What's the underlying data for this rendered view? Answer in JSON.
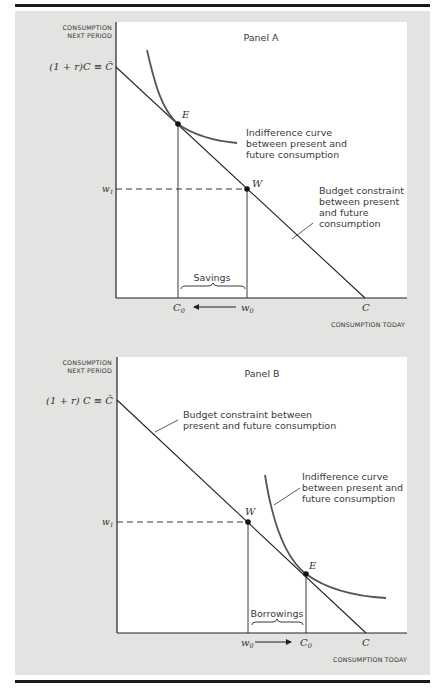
{
  "panels": [
    {
      "id": "A",
      "title": "Panel A",
      "y_axis_label_line1": "CONSUMPTION",
      "y_axis_label_line2": "NEXT PERIOD",
      "x_axis_label": "CONSUMPTION TODAY",
      "y_intercept_label": "(1 + r)C ≡ C̄",
      "y_tick_w1": "w",
      "y_tick_w1_sub": "1",
      "x_tick_C0": "C",
      "x_tick_C0_sub": "0",
      "x_tick_w0": "w",
      "x_tick_w0_sub": "0",
      "x_tick_C": "C",
      "point_E": "E",
      "point_W": "W",
      "arrow_direction": "left (w0 → C0)",
      "bracket_label": "Savings",
      "indifference_label": [
        "Indifference curve",
        "between present and",
        "future consumption"
      ],
      "budget_label": [
        "Budget constraint",
        "between present",
        "and future",
        "consumption"
      ]
    },
    {
      "id": "B",
      "title": "Panel B",
      "y_axis_label_line1": "CONSUMPTION",
      "y_axis_label_line2": "NEXT PERIOD",
      "x_axis_label": "CONSUMPTION TODAY",
      "y_intercept_label": "(1 + r) C ≡ C̄",
      "y_tick_w1": "w",
      "y_tick_w1_sub": "1",
      "x_tick_w0": "w",
      "x_tick_w0_sub": "0",
      "x_tick_C0": "C",
      "x_tick_C0_sub": "0",
      "x_tick_C": "C",
      "point_E": "E",
      "point_W": "W",
      "arrow_direction": "right (w0 → C0)",
      "bracket_label": "Borrowings",
      "budget_label": [
        "Budget constraint between",
        "present and future consumption"
      ],
      "indifference_label": [
        "Indifference curve",
        "between present and",
        "future consumption"
      ]
    }
  ],
  "colors": {
    "frame_background": "#e3e3e1",
    "plot_background": "#ffffff",
    "rule": "#1a1a1a",
    "budget_line": "#222222",
    "indifference_curve": "#555555"
  }
}
